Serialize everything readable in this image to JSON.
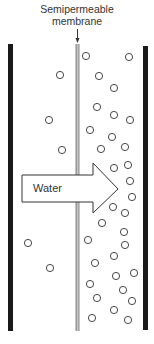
{
  "diagram": {
    "membrane_label_line1": "Semipermeable",
    "membrane_label_line2": "membrane",
    "arrow_label": "Water",
    "colors": {
      "wall": "#1a1a1a",
      "membrane": "#b0b0b0",
      "solute": "#333333",
      "arrow_stroke": "#333333"
    },
    "left_solutes": [
      {
        "x": 60,
        "y": 75
      },
      {
        "x": 49,
        "y": 120
      },
      {
        "x": 62,
        "y": 150
      },
      {
        "x": 28,
        "y": 243
      },
      {
        "x": 50,
        "y": 268
      }
    ],
    "right_solutes": [
      {
        "x": 86,
        "y": 56
      },
      {
        "x": 129,
        "y": 57
      },
      {
        "x": 99,
        "y": 76
      },
      {
        "x": 114,
        "y": 88
      },
      {
        "x": 97,
        "y": 107
      },
      {
        "x": 114,
        "y": 115
      },
      {
        "x": 130,
        "y": 120
      },
      {
        "x": 90,
        "y": 130
      },
      {
        "x": 112,
        "y": 137
      },
      {
        "x": 101,
        "y": 149
      },
      {
        "x": 125,
        "y": 147
      },
      {
        "x": 128,
        "y": 165
      },
      {
        "x": 114,
        "y": 168
      },
      {
        "x": 130,
        "y": 181
      },
      {
        "x": 132,
        "y": 197
      },
      {
        "x": 113,
        "y": 207
      },
      {
        "x": 125,
        "y": 213
      },
      {
        "x": 102,
        "y": 223
      },
      {
        "x": 124,
        "y": 232
      },
      {
        "x": 88,
        "y": 240
      },
      {
        "x": 95,
        "y": 263
      },
      {
        "x": 125,
        "y": 245
      },
      {
        "x": 114,
        "y": 256
      },
      {
        "x": 134,
        "y": 273
      },
      {
        "x": 116,
        "y": 276
      },
      {
        "x": 90,
        "y": 284
      },
      {
        "x": 123,
        "y": 290
      },
      {
        "x": 97,
        "y": 298
      },
      {
        "x": 132,
        "y": 301
      },
      {
        "x": 114,
        "y": 310
      },
      {
        "x": 92,
        "y": 318
      },
      {
        "x": 128,
        "y": 320
      }
    ]
  }
}
